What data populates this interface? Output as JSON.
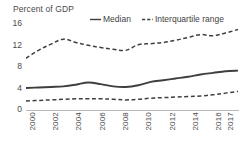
{
  "chart_data": {
    "type": "line",
    "title": "Percent of GDP",
    "xlabel": "",
    "ylabel": "Percent of GDP",
    "ylim": [
      0,
      16
    ],
    "yticks": [
      0,
      4,
      8,
      12,
      16
    ],
    "grid": false,
    "legend_position": "top-right",
    "x": [
      2000,
      2001,
      2002,
      2003,
      2004,
      2005,
      2006,
      2007,
      2008,
      2009,
      2010,
      2011,
      2012,
      2013,
      2014,
      2015,
      2016,
      2017
    ],
    "xtick_labels": [
      "2000",
      "2002",
      "2004",
      "2006",
      "2008",
      "2010",
      "2012",
      "2014",
      "2016",
      "2017"
    ],
    "xticks": [
      2000,
      2002,
      2004,
      2006,
      2008,
      2010,
      2012,
      2014,
      2016,
      2017
    ],
    "series": [
      {
        "name": "Interquartile range",
        "role": "upper-quartile",
        "style": "dashed",
        "color": "#3f3f3f",
        "values": [
          9.2,
          10.6,
          11.7,
          12.6,
          12.0,
          11.5,
          11.1,
          10.8,
          10.6,
          11.6,
          11.8,
          12.0,
          12.4,
          12.9,
          13.4,
          13.2,
          13.7,
          14.3
        ]
      },
      {
        "name": "Median",
        "role": "median",
        "style": "solid",
        "color": "#3f3f3f",
        "values": [
          3.9,
          4.0,
          4.1,
          4.2,
          4.5,
          4.9,
          4.6,
          4.2,
          4.1,
          4.4,
          5.0,
          5.3,
          5.6,
          5.9,
          6.3,
          6.6,
          6.9,
          7.0
        ]
      },
      {
        "name": "Interquartile range",
        "role": "lower-quartile",
        "style": "dashed",
        "color": "#3f3f3f",
        "values": [
          1.6,
          1.7,
          1.8,
          1.9,
          2.0,
          2.0,
          2.0,
          1.9,
          1.8,
          1.9,
          2.1,
          2.2,
          2.3,
          2.4,
          2.5,
          2.7,
          3.0,
          3.3
        ]
      }
    ],
    "legend": [
      {
        "label": "Median",
        "style": "solid",
        "color": "#3f3f3f"
      },
      {
        "label": "Interquartile range",
        "style": "dashed",
        "color": "#3f3f3f"
      }
    ]
  },
  "axis": {
    "title": "Percent of GDP",
    "ytick_0": "0",
    "ytick_4": "4",
    "ytick_8": "8",
    "ytick_12": "12",
    "ytick_16": "16",
    "xtick_0": "2000",
    "xtick_1": "2002",
    "xtick_2": "2004",
    "xtick_3": "2006",
    "xtick_4": "2008",
    "xtick_5": "2010",
    "xtick_6": "2012",
    "xtick_7": "2014",
    "xtick_8": "2016",
    "xtick_9": "2017"
  },
  "legend": {
    "median_label": "Median",
    "iqr_label": "Interquartile range"
  },
  "colors": {
    "line": "#3f3f3f",
    "axis": "#b9b9b9",
    "text": "#4a4a4a",
    "background": "#ffffff"
  }
}
